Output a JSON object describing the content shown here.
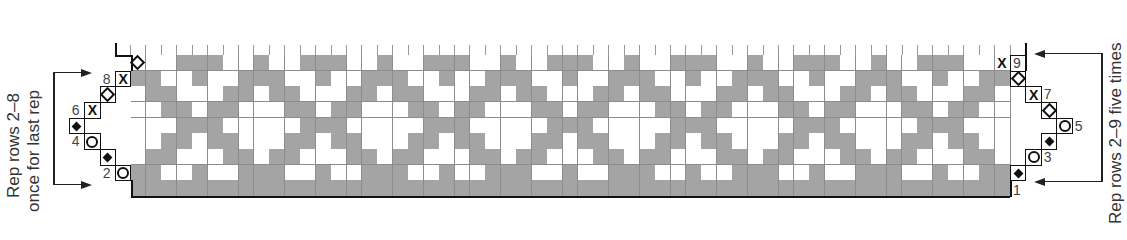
{
  "chart_data": {
    "type": "table",
    "grid": {
      "columns": 57,
      "rows": 9,
      "origin_x": 130.5,
      "origin_y_top": 55,
      "cell_w": 15.43,
      "cell_h": 15.67,
      "repeat_width": 8
    },
    "colors": {
      "contrast": "#9c9c9c",
      "main": "#ffffff",
      "border": "#111111",
      "gridline": "#8c8c8c"
    },
    "legend": {
      "G": "contrast color (gray)",
      "W": "main color (white)"
    },
    "pattern_rows": [
      {
        "row": 9,
        "repeat": [
          "G",
          "W",
          "W",
          "G",
          "G",
          "G",
          "W",
          "W"
        ]
      },
      {
        "row": 8,
        "repeat": [
          "G",
          "G",
          "W",
          "W",
          "G",
          "W",
          "W",
          "G"
        ]
      },
      {
        "row": 7,
        "repeat": [
          "W",
          "G",
          "G",
          "W",
          "W",
          "W",
          "G",
          "G"
        ]
      },
      {
        "row": 6,
        "repeat": [
          "W",
          "W",
          "G",
          "G",
          "W",
          "G",
          "G",
          "W"
        ]
      },
      {
        "row": 5,
        "repeat": [
          "W",
          "W",
          "W",
          "G",
          "G",
          "G",
          "W",
          "W"
        ]
      },
      {
        "row": 4,
        "repeat": [
          "W",
          "W",
          "G",
          "G",
          "W",
          "G",
          "G",
          "W"
        ]
      },
      {
        "row": 3,
        "repeat": [
          "W",
          "G",
          "G",
          "W",
          "W",
          "W",
          "G",
          "G"
        ]
      },
      {
        "row": 2,
        "repeat": [
          "G",
          "G",
          "W",
          "W",
          "G",
          "W",
          "W",
          "G"
        ]
      },
      {
        "row": 1,
        "repeat": [
          "G",
          "G",
          "G",
          "G",
          "G",
          "G",
          "G",
          "G"
        ]
      }
    ],
    "symbols": [
      {
        "row": 9,
        "col": 0,
        "symbol": "open-diamond"
      },
      {
        "row": 9,
        "col": 56,
        "symbol": "x"
      },
      {
        "row": 8,
        "col": -1,
        "symbol": "x"
      },
      {
        "row": 8,
        "col": 57,
        "symbol": "open-diamond"
      },
      {
        "row": 7,
        "col": -2,
        "symbol": "open-diamond"
      },
      {
        "row": 7,
        "col": 58,
        "symbol": "x"
      },
      {
        "row": 6,
        "col": -3,
        "symbol": "x"
      },
      {
        "row": 6,
        "col": 59,
        "symbol": "open-diamond"
      },
      {
        "row": 5,
        "col": -4,
        "symbol": "filled-diamond"
      },
      {
        "row": 5,
        "col": 60,
        "symbol": "circle"
      },
      {
        "row": 4,
        "col": -3,
        "symbol": "circle"
      },
      {
        "row": 4,
        "col": 59,
        "symbol": "filled-diamond"
      },
      {
        "row": 3,
        "col": -2,
        "symbol": "filled-diamond"
      },
      {
        "row": 3,
        "col": 58,
        "symbol": "circle"
      },
      {
        "row": 2,
        "col": -1,
        "symbol": "circle"
      },
      {
        "row": 2,
        "col": 57,
        "symbol": "filled-diamond"
      }
    ],
    "row_labels": [
      {
        "text": "1",
        "row": 1,
        "side": "right",
        "col": 57
      },
      {
        "text": "2",
        "row": 2,
        "side": "left",
        "col": -2
      },
      {
        "text": "3",
        "row": 3,
        "side": "right",
        "col": 59
      },
      {
        "text": "4",
        "row": 4,
        "side": "left",
        "col": -4
      },
      {
        "text": "5",
        "row": 5,
        "side": "right",
        "col": 61
      },
      {
        "text": "6",
        "row": 6,
        "side": "left",
        "col": -4
      },
      {
        "text": "7",
        "row": 7,
        "side": "right",
        "col": 59
      },
      {
        "text": "8",
        "row": 8,
        "side": "left",
        "col": -2
      },
      {
        "text": "9",
        "row": 9,
        "side": "right",
        "col": 57
      }
    ],
    "annotations": {
      "left": {
        "line1": "Rep rows 2–8",
        "line2": "once for last rep",
        "from_row": 2,
        "to_row": 8
      },
      "right": {
        "text": "Rep rows 2–9 five times",
        "from_row": 2,
        "to_row": 9
      }
    }
  }
}
